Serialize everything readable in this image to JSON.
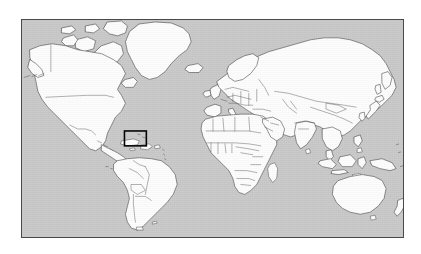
{
  "figure": {
    "type": "world-map",
    "title": "",
    "caption": "",
    "projection": "equirectangular",
    "colors": {
      "ocean": "#c9c9c9",
      "land": "#fdfdfd",
      "coastline": "#3a3a3a",
      "country_border": "#3a3a3a",
      "frame": "#4a4a4a",
      "highlight_box": "#000000",
      "background": "#ffffff"
    },
    "frame": {
      "x": 21,
      "y": 19,
      "width": 383,
      "height": 219,
      "border_width": 1
    },
    "highlight": {
      "label": "study-area-box",
      "region": "Caribbean / Central America",
      "x": 124,
      "y": 131,
      "width": 22,
      "height": 15,
      "stroke": "#000000",
      "stroke_width": 1.6
    },
    "landmasses": [
      "North America",
      "South America",
      "Greenland",
      "Europe",
      "Africa",
      "Asia",
      "Australia",
      "New Zealand",
      "Madagascar",
      "Iceland",
      "British Isles",
      "Japan",
      "Indonesia",
      "Philippines",
      "Sri Lanka"
    ],
    "features": {
      "country_borders": true,
      "graticule": false,
      "labels": false,
      "legend": false,
      "scale_bar": false,
      "north_arrow": false,
      "antarctica": false
    }
  }
}
